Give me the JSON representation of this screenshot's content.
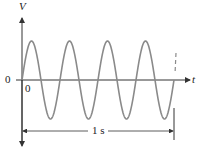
{
  "diagram": {
    "type": "sine-wave",
    "y_axis_label": "V",
    "x_axis_label": "t",
    "origin_left_label": "0",
    "origin_below_label": "0",
    "duration_label": "1 s",
    "cycles": 4,
    "colors": {
      "wave": "#8a8a8a",
      "axes": "#333333"
    }
  }
}
